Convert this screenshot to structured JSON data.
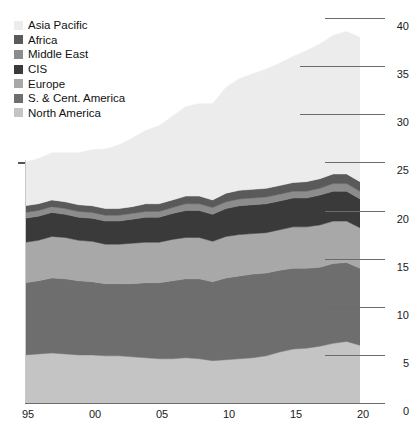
{
  "chart_data": {
    "type": "area",
    "stacked": true,
    "title": "",
    "subtitle": "",
    "xlabel": "",
    "ylabel": "",
    "xlim": [
      1995,
      2020
    ],
    "ylim": [
      0,
      40
    ],
    "y_axis_position": "right",
    "y_ticks": [
      40,
      35,
      30,
      25,
      20,
      15,
      10,
      5,
      0
    ],
    "y_tick_labels": [
      "40",
      "35",
      "30",
      "25",
      "20",
      "15",
      "10",
      "5",
      "0"
    ],
    "x_ticks": [
      1995,
      2000,
      2005,
      2010,
      2015,
      2020
    ],
    "x_tick_labels": [
      "95",
      "00",
      "05",
      "10",
      "15",
      "20"
    ],
    "grid": false,
    "legend_position": "top-left",
    "x": [
      1995,
      1996,
      1997,
      1998,
      1999,
      2000,
      2001,
      2002,
      2003,
      2004,
      2005,
      2006,
      2007,
      2008,
      2009,
      2010,
      2011,
      2012,
      2013,
      2014,
      2015,
      2016,
      2017,
      2018,
      2019,
      2020
    ],
    "series": [
      {
        "name": "North America",
        "color": "#c4c4c4",
        "values": [
          5.0,
          5.1,
          5.2,
          5.1,
          5.0,
          5.0,
          4.9,
          4.9,
          4.8,
          4.7,
          4.6,
          4.6,
          4.7,
          4.6,
          4.4,
          4.5,
          4.6,
          4.7,
          4.9,
          5.3,
          5.6,
          5.7,
          5.9,
          6.2,
          6.4,
          6.0
        ]
      },
      {
        "name": "S. & Cent. America",
        "color": "#6e6e6e",
        "values": [
          7.5,
          7.6,
          7.8,
          7.8,
          7.7,
          7.6,
          7.5,
          7.5,
          7.6,
          7.8,
          7.9,
          8.1,
          8.2,
          8.3,
          8.2,
          8.5,
          8.6,
          8.7,
          8.6,
          8.5,
          8.4,
          8.3,
          8.2,
          8.3,
          8.2,
          8.0
        ]
      },
      {
        "name": "Europe",
        "color": "#a8a8a8",
        "values": [
          4.2,
          4.2,
          4.3,
          4.3,
          4.2,
          4.2,
          4.1,
          4.1,
          4.2,
          4.2,
          4.2,
          4.3,
          4.3,
          4.3,
          4.2,
          4.3,
          4.3,
          4.2,
          4.2,
          4.2,
          4.3,
          4.3,
          4.4,
          4.4,
          4.3,
          4.2
        ]
      },
      {
        "name": "CIS",
        "color": "#3a3a3a",
        "values": [
          2.5,
          2.5,
          2.5,
          2.4,
          2.4,
          2.4,
          2.4,
          2.4,
          2.5,
          2.6,
          2.6,
          2.7,
          2.8,
          2.8,
          2.8,
          2.9,
          3.0,
          3.0,
          3.0,
          3.0,
          3.0,
          3.0,
          3.1,
          3.1,
          3.1,
          3.0
        ]
      },
      {
        "name": "Middle East",
        "color": "#8c8c8c",
        "values": [
          0.6,
          0.6,
          0.6,
          0.6,
          0.6,
          0.6,
          0.6,
          0.6,
          0.6,
          0.6,
          0.6,
          0.6,
          0.7,
          0.7,
          0.7,
          0.7,
          0.7,
          0.7,
          0.7,
          0.7,
          0.7,
          0.7,
          0.7,
          0.8,
          0.8,
          0.8
        ]
      },
      {
        "name": "Africa",
        "color": "#5a5a5a",
        "values": [
          0.7,
          0.7,
          0.7,
          0.7,
          0.7,
          0.7,
          0.7,
          0.7,
          0.7,
          0.8,
          0.8,
          0.8,
          0.8,
          0.8,
          0.8,
          0.9,
          0.9,
          0.9,
          0.9,
          0.9,
          0.9,
          1.0,
          1.0,
          1.0,
          1.0,
          1.0
        ]
      },
      {
        "name": "Asia Pacific",
        "color": "#ececec",
        "values": [
          4.5,
          4.7,
          4.9,
          5.1,
          5.4,
          5.8,
          6.2,
          6.6,
          7.1,
          7.6,
          8.1,
          8.7,
          9.3,
          9.6,
          10.0,
          11.0,
          11.6,
          12.0,
          12.4,
          12.7,
          13.1,
          13.6,
          14.0,
          14.4,
          14.8,
          15.0
        ]
      }
    ],
    "legend_order": [
      "Asia Pacific",
      "Africa",
      "Middle East",
      "CIS",
      "Europe",
      "S. & Cent. America",
      "North America"
    ]
  },
  "legend": {
    "items": [
      {
        "label": "Asia Pacific",
        "color": "#ececec"
      },
      {
        "label": "Africa",
        "color": "#5a5a5a"
      },
      {
        "label": "Middle East",
        "color": "#8c8c8c"
      },
      {
        "label": "CIS",
        "color": "#3a3a3a"
      },
      {
        "label": "Europe",
        "color": "#a8a8a8"
      },
      {
        "label": "S. & Cent. America",
        "color": "#6e6e6e"
      },
      {
        "label": "North America",
        "color": "#c4c4c4"
      }
    ]
  },
  "axes": {
    "y_labels": [
      "40",
      "35",
      "30",
      "25",
      "20",
      "15",
      "10",
      "5",
      "0"
    ],
    "x_labels": [
      "95",
      "00",
      "05",
      "10",
      "15",
      "20"
    ]
  }
}
